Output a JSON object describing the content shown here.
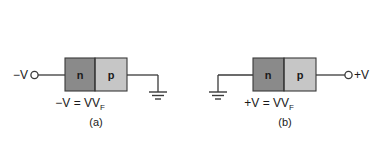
{
  "figure": {
    "background_color": "#ffffff",
    "stroke_color": "#3a3a3a",
    "text_color": "#1a1a1a",
    "n_region_color": "#8a8a8a",
    "p_region_color": "#c6c6c6",
    "panels": [
      {
        "id": "a",
        "caption": "(a)",
        "terminal_label": "−V",
        "terminal_side": "left",
        "ground_side": "right",
        "bias_main": "−V  =  V",
        "bias_subscript": "F",
        "bias_full": "−V = VF",
        "n_label": "n",
        "p_label": "p",
        "n_side": "left",
        "p_side": "right"
      },
      {
        "id": "b",
        "caption": "(b)",
        "terminal_label": "+V",
        "terminal_side": "right",
        "ground_side": "left",
        "bias_main": "+V  =  V",
        "bias_subscript": "F",
        "bias_full": "+V = VF",
        "n_label": "n",
        "p_label": "p",
        "n_side": "left",
        "p_side": "right"
      }
    ]
  }
}
